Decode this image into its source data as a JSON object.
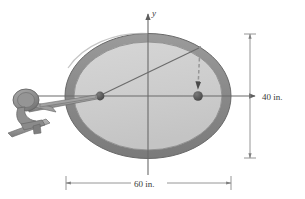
{
  "figure": {
    "axes": {
      "x_label": "x",
      "y_label": "y"
    },
    "dimensions": {
      "height_label": "40 in.",
      "width_label": "60 in."
    },
    "colors": {
      "rim": "#8a8a8a",
      "rim_stroke": "#6d6d6d",
      "table_fill": "#cfcfcf",
      "axis": "#6b6b6b",
      "dot": "#5a5a5a",
      "line": "#6b6b6b",
      "dashed": "#8f8f8f",
      "cue_body": "#9a9a9a",
      "cue_dark": "#787878",
      "dim_line": "#8b8b8b",
      "background": "#ffffff"
    },
    "geometry": {
      "center_x": 148,
      "center_y": 96,
      "semi_major": 82,
      "semi_minor": 62,
      "left_focus_x": 100,
      "right_focus_x": 198,
      "dashed_top_y": 48
    },
    "icons": {
      "x_axis_arrow": "arrow-right-icon",
      "y_axis_arrow": "arrow-up-icon",
      "dashed_arrow": "arrow-down-icon",
      "cue_stick": "cue-stick-icon",
      "clamp": "clamp-mechanism-icon"
    },
    "elements": {
      "table_name": "elliptical-table",
      "left_focus_name": "left-focus-point",
      "right_focus_name": "right-focus-point",
      "chord_name": "focal-chord-line"
    }
  }
}
